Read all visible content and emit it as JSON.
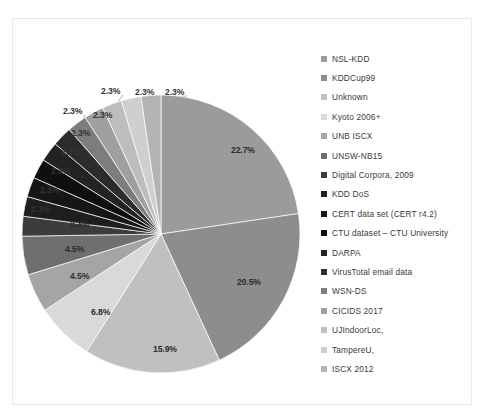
{
  "figure": {
    "background": "#ffffff",
    "border_color": "#e9e9e9"
  },
  "chart_data": {
    "type": "pie",
    "title": "",
    "xlabel": "",
    "ylabel": "",
    "legend_position": "right",
    "grid": false,
    "categories": [
      "NSL-KDD",
      "KDDCup99",
      "Unknown",
      "Kyoto 2006+",
      "UNB ISCX",
      "UNSW-NB15",
      "Digital Corpora, 2009",
      "KDD DoS",
      "CERT data set (CERT r4.2)",
      "CTU dataset – CTU University",
      "DARPA",
      "VirusTotal email data",
      "WSN-DS",
      "CICIDS 2017",
      "UJIndoorLoc,",
      "TampereU,",
      "ISCX 2012"
    ],
    "values": [
      22.7,
      20.5,
      15.9,
      6.8,
      4.5,
      4.5,
      2.3,
      2.3,
      2.3,
      2.3,
      2.3,
      2.3,
      2.3,
      2.3,
      2.3,
      2.3,
      2.3
    ],
    "value_unit": "%",
    "colors": [
      "#9b9b9b",
      "#8d8d8d",
      "#c0c0c0",
      "#d9d9d9",
      "#a5a5a5",
      "#6f6f6f",
      "#3c3c3c",
      "#1e1e1e",
      "#161616",
      "#0f0f0f",
      "#232323",
      "#2c2c2c",
      "#7d7d7d",
      "#9f9f9f",
      "#bdbdbd",
      "#cfcfcf",
      "#b3b3b3"
    ],
    "labels": [
      "22.7%",
      "20.5%",
      "15.9%",
      "6.8%",
      "4.5%",
      "4.5%",
      "2.3%",
      "2.3%",
      "2.3%",
      "2.3%",
      "2.3%",
      "2.3%",
      "2.3%",
      "2.3%",
      "2.3%",
      "2.3%",
      "2.3%"
    ],
    "ylim": [
      0,
      100
    ]
  },
  "legend": {
    "items": [
      {
        "label": "NSL-KDD",
        "color": "#9b9b9b"
      },
      {
        "label": "KDDCup99",
        "color": "#8d8d8d"
      },
      {
        "label": "Unknown",
        "color": "#c0c0c0"
      },
      {
        "label": "Kyoto 2006+",
        "color": "#d9d9d9"
      },
      {
        "label": "UNB ISCX",
        "color": "#a5a5a5"
      },
      {
        "label": "UNSW-NB15",
        "color": "#6f6f6f"
      },
      {
        "label": "Digital Corpora, 2009",
        "color": "#3c3c3c"
      },
      {
        "label": "KDD DoS",
        "color": "#1e1e1e"
      },
      {
        "label": "CERT data set (CERT r4.2)",
        "color": "#161616"
      },
      {
        "label": "CTU dataset – CTU University",
        "color": "#0f0f0f"
      },
      {
        "label": "DARPA",
        "color": "#232323"
      },
      {
        "label": "VirusTotal email data",
        "color": "#2c2c2c"
      },
      {
        "label": "WSN-DS",
        "color": "#7d7d7d"
      },
      {
        "label": "CICIDS 2017",
        "color": "#9f9f9f"
      },
      {
        "label": "UJIndoorLoc,",
        "color": "#bdbdbd"
      },
      {
        "label": "TampereU,",
        "color": "#cfcfcf"
      },
      {
        "label": "ISCX 2012",
        "color": "#b3b3b3"
      }
    ]
  },
  "slice_labels": [
    {
      "text": "22.7%",
      "x": 218,
      "y": 126,
      "mode": "on-slice"
    },
    {
      "text": "20.5%",
      "x": 224,
      "y": 258,
      "mode": "on-slice"
    },
    {
      "text": "15.9%",
      "x": 140,
      "y": 325,
      "mode": "on-slice"
    },
    {
      "text": "6.8%",
      "x": 78,
      "y": 288,
      "mode": "on-slice"
    },
    {
      "text": "4.5%",
      "x": 57,
      "y": 252,
      "mode": "on-dark"
    },
    {
      "text": "4.5%",
      "x": 52,
      "y": 225,
      "mode": "on-slice"
    },
    {
      "text": "2.3%",
      "x": 57,
      "y": 200,
      "mode": "on-dark"
    },
    {
      "text": "2.3%",
      "x": 18,
      "y": 185,
      "mode": "outside"
    },
    {
      "text": "2.3%",
      "x": 27,
      "y": 166,
      "mode": "outside"
    },
    {
      "text": "2.3%",
      "x": 38,
      "y": 147,
      "mode": "outside"
    },
    {
      "text": "2.3%",
      "x": 48,
      "y": 128,
      "mode": "outside"
    },
    {
      "text": "2.3%",
      "x": 58,
      "y": 109,
      "mode": "outside"
    },
    {
      "text": "2.3%",
      "x": 50,
      "y": 87,
      "mode": "outside"
    },
    {
      "text": "2.3%",
      "x": 80,
      "y": 91,
      "mode": "outside"
    },
    {
      "text": "2.3%",
      "x": 88,
      "y": 67,
      "mode": "outside"
    },
    {
      "text": "2.3%",
      "x": 122,
      "y": 68,
      "mode": "outside"
    },
    {
      "text": "2.3%",
      "x": 152,
      "y": 68,
      "mode": "outside"
    }
  ]
}
